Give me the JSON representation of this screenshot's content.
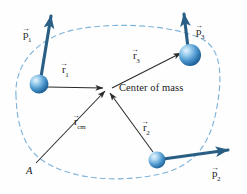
{
  "figure": {
    "background_color": "#fefefe",
    "width": 247,
    "height": 194
  },
  "colors": {
    "particle_blue": "#3f8ecb",
    "particle_dark": "#1d5f95",
    "particle_highlight": "#cfe6f6",
    "momentum_arrow": "#2a5f85",
    "position_arrow": "#2b2b2b",
    "boundary_dashed": "#7fb4db",
    "text": "#1b1b1b"
  },
  "labels": {
    "center_of_mass": "Center of mass",
    "origin_point": "A"
  },
  "momentum_vectors": [
    {
      "id": "p1",
      "symbol": "p",
      "subscript": "1",
      "accent": "arrow",
      "label_x": 23,
      "label_y": 29
    },
    {
      "id": "p2",
      "symbol": "p",
      "subscript": "2",
      "accent": "arrow",
      "label_x": 212,
      "label_y": 168
    },
    {
      "id": "p3",
      "symbol": "p",
      "subscript": "3",
      "accent": "arrow",
      "label_x": 196,
      "label_y": 26
    }
  ],
  "position_vectors": [
    {
      "id": "r1",
      "symbol": "r",
      "subscript": "1",
      "accent": "arrow",
      "label_x": 62,
      "label_y": 64
    },
    {
      "id": "r2",
      "symbol": "r",
      "subscript": "2",
      "accent": "arrow",
      "label_x": 143,
      "label_y": 122
    },
    {
      "id": "r3",
      "symbol": "r",
      "subscript": "3",
      "accent": "arrow",
      "label_x": 133,
      "label_y": 50
    },
    {
      "id": "rcm",
      "symbol": "r",
      "subscript": "cm",
      "accent": "arrow",
      "label_x": 74,
      "label_y": 116
    }
  ],
  "particles": [
    {
      "id": "particle-1",
      "cx": 39,
      "cy": 84,
      "r": 9.5
    },
    {
      "id": "particle-2",
      "cx": 157,
      "cy": 160,
      "r": 8.5
    },
    {
      "id": "particle-3",
      "cx": 190,
      "cy": 55,
      "r": 11
    }
  ],
  "center_of_mass_point": {
    "x": 108,
    "y": 88
  },
  "origin_point_coords": {
    "x": 34,
    "y": 166
  }
}
